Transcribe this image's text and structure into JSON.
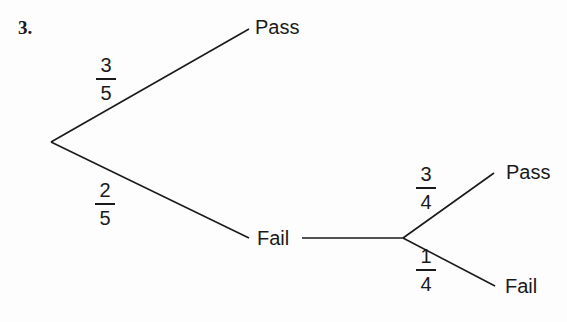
{
  "question_number": "3.",
  "tree": {
    "root": {
      "branches": [
        {
          "probability": {
            "numerator": "3",
            "denominator": "5"
          },
          "outcome": "Pass"
        },
        {
          "probability": {
            "numerator": "2",
            "denominator": "5"
          },
          "outcome": "Fail",
          "branches": [
            {
              "probability": {
                "numerator": "3",
                "denominator": "4"
              },
              "outcome": "Pass"
            },
            {
              "probability": {
                "numerator": "1",
                "denominator": "4"
              },
              "outcome": "Fail"
            }
          ]
        }
      ]
    }
  },
  "colors": {
    "line": "#1a1a1a",
    "text": "#1a1a1a",
    "background": "#fdfdfd"
  }
}
